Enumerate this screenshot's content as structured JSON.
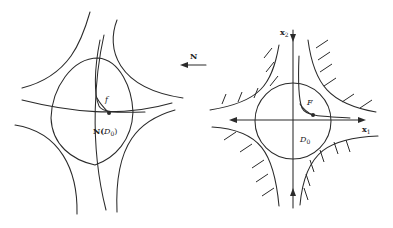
{
  "figure": {
    "left_panel": {
      "name": "image-domain",
      "labels": {
        "map_region_prefix": "N(",
        "map_region_var": "D",
        "map_region_sub": "0",
        "map_region_suffix": ")",
        "curve": "f"
      }
    },
    "mapping_arrow": {
      "label": "N",
      "direction": "left"
    },
    "right_panel": {
      "name": "source-domain",
      "labels": {
        "domain_var": "D",
        "domain_sub": "0",
        "curve": "F",
        "x_axis_var": "x",
        "x_axis_sub": "1",
        "y_axis_var": "x",
        "y_axis_sub": "2"
      }
    },
    "colors": {
      "ink": "#2a2a2a",
      "background": "#ffffff"
    }
  }
}
